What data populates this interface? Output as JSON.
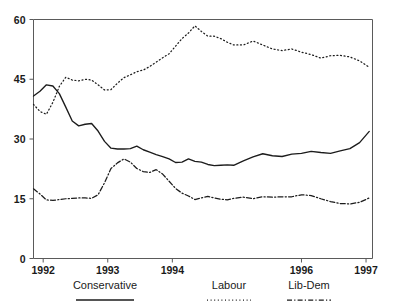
{
  "chart_data": {
    "type": "line",
    "title": "",
    "subtitle": "",
    "xlabel": "",
    "ylabel": "",
    "xlim": [
      1991.85,
      1997.1
    ],
    "ylim": [
      0,
      60
    ],
    "grid": false,
    "legend_position": "below-axis",
    "y_ticks": [
      0,
      15,
      30,
      45,
      60
    ],
    "y_tick_labels": [
      "0",
      "15",
      "30",
      "45",
      "60"
    ],
    "x_ticks": [
      1992,
      1993,
      1994,
      1996,
      1997
    ],
    "x_tick_labels": [
      "1992",
      "1993",
      "1994",
      "1996",
      "1997"
    ],
    "annotations": [],
    "series": [
      {
        "name": "Conservative",
        "style": "solid",
        "color": "#1c1c1c",
        "x": [
          1991.85,
          1991.95,
          1992.05,
          1992.15,
          1992.25,
          1992.35,
          1992.45,
          1992.55,
          1992.65,
          1992.75,
          1992.85,
          1992.95,
          1993.05,
          1993.15,
          1993.25,
          1993.35,
          1993.45,
          1993.55,
          1993.65,
          1993.75,
          1993.85,
          1993.95,
          1994.05,
          1994.15,
          1994.25,
          1994.35,
          1994.45,
          1994.55,
          1994.65,
          1994.75,
          1994.85,
          1994.95,
          1995.1,
          1995.25,
          1995.4,
          1995.55,
          1995.7,
          1995.85,
          1996.0,
          1996.15,
          1996.3,
          1996.45,
          1996.6,
          1996.75,
          1996.9,
          1997.05
        ],
        "y": [
          40.8,
          42.0,
          43.6,
          43.3,
          41.4,
          38.0,
          34.5,
          33.3,
          33.7,
          33.9,
          32.0,
          29.4,
          27.7,
          27.5,
          27.5,
          27.6,
          28.2,
          27.3,
          26.7,
          26.1,
          25.6,
          25.0,
          24.1,
          24.2,
          25.0,
          24.4,
          24.2,
          23.6,
          23.3,
          23.4,
          23.5,
          23.4,
          24.5,
          25.5,
          26.3,
          25.8,
          25.6,
          26.2,
          26.4,
          26.9,
          26.6,
          26.4,
          27.0,
          27.6,
          29.1,
          31.9
        ]
      },
      {
        "name": "Labour",
        "style": "dotted",
        "color": "#2a2a2a",
        "x": [
          1991.85,
          1991.95,
          1992.05,
          1992.15,
          1992.25,
          1992.35,
          1992.45,
          1992.55,
          1992.65,
          1992.75,
          1992.85,
          1992.95,
          1993.05,
          1993.15,
          1993.25,
          1993.35,
          1993.45,
          1993.55,
          1993.65,
          1993.75,
          1993.85,
          1993.95,
          1994.05,
          1994.15,
          1994.25,
          1994.35,
          1994.45,
          1994.55,
          1994.65,
          1994.75,
          1994.85,
          1994.95,
          1995.1,
          1995.25,
          1995.4,
          1995.55,
          1995.7,
          1995.85,
          1996.0,
          1996.15,
          1996.3,
          1996.45,
          1996.6,
          1996.75,
          1996.9,
          1997.05
        ],
        "y": [
          38.7,
          36.9,
          36.2,
          39.2,
          43.2,
          45.5,
          44.8,
          44.6,
          45.0,
          44.8,
          43.6,
          42.3,
          42.4,
          44.0,
          45.4,
          46.1,
          46.9,
          47.3,
          48.2,
          49.3,
          50.4,
          51.4,
          53.3,
          55.2,
          56.6,
          58.4,
          57.0,
          55.8,
          55.8,
          55.2,
          54.3,
          53.6,
          53.6,
          54.6,
          53.6,
          52.6,
          52.2,
          52.6,
          51.8,
          51.2,
          50.3,
          50.9,
          51.0,
          50.6,
          49.6,
          48.0
        ]
      },
      {
        "name": "Lib-Dem",
        "style": "dash-dot",
        "color": "#1c1c1c",
        "x": [
          1991.85,
          1991.95,
          1992.05,
          1992.15,
          1992.25,
          1992.35,
          1992.45,
          1992.55,
          1992.65,
          1992.75,
          1992.85,
          1992.95,
          1993.05,
          1993.15,
          1993.25,
          1993.35,
          1993.45,
          1993.55,
          1993.65,
          1993.75,
          1993.85,
          1993.95,
          1994.05,
          1994.15,
          1994.25,
          1994.35,
          1994.45,
          1994.55,
          1994.65,
          1994.75,
          1994.85,
          1994.95,
          1995.1,
          1995.25,
          1995.4,
          1995.55,
          1995.7,
          1995.85,
          1996.0,
          1996.15,
          1996.3,
          1996.45,
          1996.6,
          1996.75,
          1996.9,
          1997.05
        ],
        "y": [
          17.5,
          16.2,
          14.7,
          14.6,
          14.8,
          15.0,
          15.1,
          15.2,
          15.2,
          15.1,
          16.0,
          19.0,
          22.6,
          24.0,
          25.0,
          24.2,
          22.6,
          21.8,
          21.6,
          22.3,
          21.2,
          19.4,
          17.6,
          16.4,
          15.7,
          14.8,
          15.2,
          15.6,
          15.2,
          14.9,
          14.7,
          15.1,
          15.4,
          15.0,
          15.5,
          15.4,
          15.5,
          15.5,
          16.0,
          15.8,
          15.0,
          14.3,
          13.8,
          13.7,
          14.1,
          15.2
        ]
      }
    ]
  },
  "legend": {
    "items": [
      {
        "label": "Conservative",
        "style": "solid"
      },
      {
        "label": "Labour",
        "style": "dotted"
      },
      {
        "label": "Lib-Dem",
        "style": "dash-dot"
      }
    ]
  }
}
